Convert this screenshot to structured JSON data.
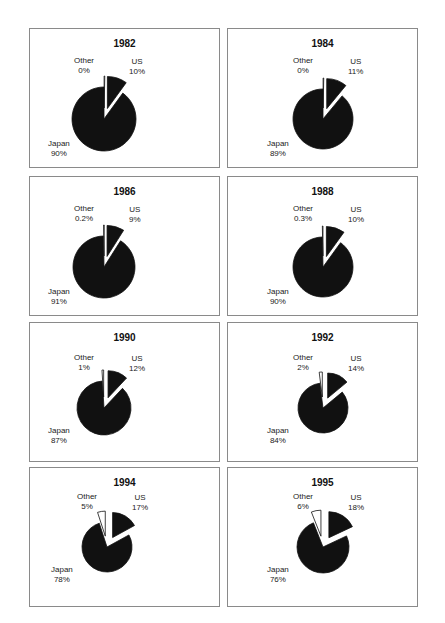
{
  "chart_data": [
    {
      "type": "pie",
      "title": "1982",
      "categories": [
        "Japan",
        "US",
        "Other"
      ],
      "values": [
        90,
        10,
        0
      ],
      "labels": [
        "90%",
        "10%",
        "0%"
      ],
      "exploded": [
        "US",
        "Other"
      ]
    },
    {
      "type": "pie",
      "title": "1984",
      "categories": [
        "Japan",
        "US",
        "Other"
      ],
      "values": [
        89,
        11,
        0
      ],
      "labels": [
        "89%",
        "11%",
        "0%"
      ],
      "exploded": [
        "US",
        "Other"
      ]
    },
    {
      "type": "pie",
      "title": "1986",
      "categories": [
        "Japan",
        "US",
        "Other"
      ],
      "values": [
        91,
        9,
        0.2
      ],
      "labels": [
        "91%",
        "9%",
        "0.2%"
      ],
      "exploded": [
        "US",
        "Other"
      ]
    },
    {
      "type": "pie",
      "title": "1988",
      "categories": [
        "Japan",
        "US",
        "Other"
      ],
      "values": [
        90,
        10,
        0.3
      ],
      "labels": [
        "90%",
        "10%",
        "0.3%"
      ],
      "exploded": [
        "US",
        "Other"
      ]
    },
    {
      "type": "pie",
      "title": "1990",
      "categories": [
        "Japan",
        "US",
        "Other"
      ],
      "values": [
        87,
        12,
        1
      ],
      "labels": [
        "87%",
        "12%",
        "1%"
      ],
      "exploded": [
        "US",
        "Other"
      ]
    },
    {
      "type": "pie",
      "title": "1992",
      "categories": [
        "Japan",
        "US",
        "Other"
      ],
      "values": [
        84,
        14,
        2
      ],
      "labels": [
        "84%",
        "14%",
        "2%"
      ],
      "exploded": [
        "US",
        "Other"
      ]
    },
    {
      "type": "pie",
      "title": "1994",
      "categories": [
        "Japan",
        "US",
        "Other"
      ],
      "values": [
        78,
        17,
        5
      ],
      "labels": [
        "78%",
        "17%",
        "5%"
      ],
      "exploded": [
        "US",
        "Other"
      ]
    },
    {
      "type": "pie",
      "title": "1995",
      "categories": [
        "Japan",
        "US",
        "Other"
      ],
      "values": [
        76,
        18,
        6
      ],
      "labels": [
        "76%",
        "18%",
        "6%"
      ],
      "exploded": [
        "US",
        "Other"
      ]
    }
  ],
  "colors": {
    "Japan": "#111111",
    "US": "#111111",
    "Other": "#ffffff",
    "border": "#8a8a8a"
  },
  "layout": {
    "panels": [
      {
        "x": 29,
        "y": 28,
        "cx": 74,
        "cy": 90,
        "r": 32
      },
      {
        "x": 227,
        "y": 28,
        "cx": 95,
        "cy": 90,
        "r": 30
      },
      {
        "x": 29,
        "y": 176,
        "cx": 74,
        "cy": 90,
        "r": 31
      },
      {
        "x": 227,
        "y": 176,
        "cx": 95,
        "cy": 90,
        "r": 30
      },
      {
        "x": 29,
        "y": 322,
        "cx": 74,
        "cy": 85,
        "r": 27
      },
      {
        "x": 227,
        "y": 322,
        "cx": 95,
        "cy": 85,
        "r": 25
      },
      {
        "x": 29,
        "y": 467,
        "cx": 77,
        "cy": 79,
        "r": 25
      },
      {
        "x": 227,
        "y": 467,
        "cx": 95,
        "cy": 79,
        "r": 26
      }
    ]
  }
}
